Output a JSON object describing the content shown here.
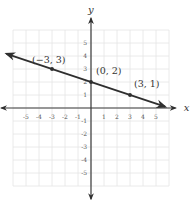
{
  "chart_data": {
    "type": "line",
    "title": "",
    "xlabel": "x",
    "ylabel": "y",
    "xlim": [
      -6,
      6
    ],
    "ylim": [
      -6,
      6
    ],
    "grid": true,
    "x_ticks": [
      -5,
      -4,
      -3,
      -2,
      -1,
      1,
      2,
      3,
      4,
      5
    ],
    "y_ticks": [
      5,
      4,
      3,
      2,
      1,
      -1,
      -2,
      -3,
      -4,
      -5
    ],
    "line": {
      "equation": "y = -1/3 x + 2",
      "slope": -0.3333,
      "intercept": 2,
      "extends_both_directions": true,
      "start": [
        -6.5,
        4.17
      ],
      "end": [
        5.7,
        0.1
      ]
    },
    "points": [
      {
        "x": -3,
        "y": 3,
        "label": "(−3, 3)"
      },
      {
        "x": 0,
        "y": 2,
        "label": "(0, 2)"
      },
      {
        "x": 3,
        "y": 1,
        "label": "(3, 1)"
      }
    ]
  },
  "layout": {
    "origin_px": [
      91,
      108
    ],
    "unit_px": 13
  },
  "colors": {
    "grid": "#e4e4e4",
    "axis": "#3a3a3a",
    "line": "#2f2f2f",
    "text": "#333333"
  }
}
